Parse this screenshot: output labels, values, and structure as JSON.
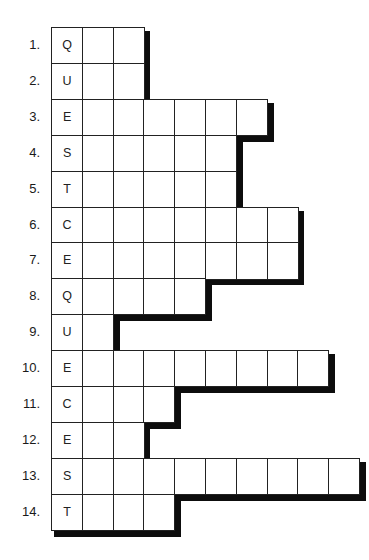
{
  "puzzle": {
    "type": "acrostic-word-ladder",
    "key_word_vertical": "QUESTCEQUESTCEST",
    "rows": [
      {
        "number": "1.",
        "letter": "Q",
        "length": 3
      },
      {
        "number": "2.",
        "letter": "U",
        "length": 3
      },
      {
        "number": "3.",
        "letter": "E",
        "length": 7
      },
      {
        "number": "4.",
        "letter": "S",
        "length": 6
      },
      {
        "number": "5.",
        "letter": "T",
        "length": 6
      },
      {
        "number": "6.",
        "letter": "C",
        "length": 8
      },
      {
        "number": "7.",
        "letter": "E",
        "length": 8
      },
      {
        "number": "8.",
        "letter": "Q",
        "length": 5
      },
      {
        "number": "9.",
        "letter": "U",
        "length": 2
      },
      {
        "number": "10.",
        "letter": "E",
        "length": 9
      },
      {
        "number": "11.",
        "letter": "C",
        "length": 4
      },
      {
        "number": "12.",
        "letter": "E",
        "length": 3
      },
      {
        "number": "13.",
        "letter": "S",
        "length": 10
      },
      {
        "number": "14.",
        "letter": "T",
        "length": 4
      }
    ],
    "colors": {
      "background": "#ffffff",
      "grid_line": "#222222",
      "shadow": "#0d0d0d",
      "text": "#1a1a1a"
    }
  }
}
